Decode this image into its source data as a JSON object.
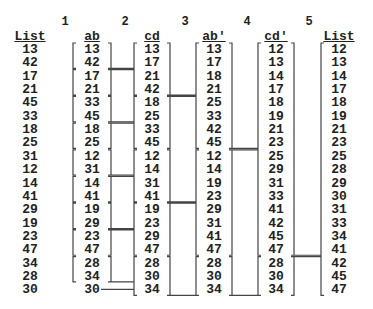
{
  "steps": [
    "1",
    "2",
    "3",
    "4",
    "5"
  ],
  "columns": [
    {
      "header": "List",
      "values": [
        "13",
        "42",
        "17",
        "21",
        "45",
        "33",
        "18",
        "25",
        "31",
        "12",
        "14",
        "41",
        "29",
        "19",
        "23",
        "47",
        "34",
        "28",
        "30"
      ]
    },
    {
      "header": "ab",
      "values": [
        "13",
        "42",
        "17",
        "21",
        "33",
        "45",
        "18",
        "25",
        "12",
        "31",
        "14",
        "41",
        "19",
        "29",
        "23",
        "47",
        "28",
        "34",
        "30"
      ]
    },
    {
      "header": "cd",
      "values": [
        "13",
        "17",
        "21",
        "42",
        "18",
        "25",
        "33",
        "45",
        "12",
        "14",
        "31",
        "41",
        "19",
        "23",
        "29",
        "47",
        "28",
        "30",
        "34"
      ]
    },
    {
      "header": "ab'",
      "values": [
        "13",
        "17",
        "18",
        "21",
        "25",
        "33",
        "42",
        "45",
        "12",
        "14",
        "19",
        "23",
        "29",
        "31",
        "41",
        "47",
        "28",
        "30",
        "34"
      ]
    },
    {
      "header": "cd'",
      "values": [
        "12",
        "13",
        "14",
        "17",
        "18",
        "19",
        "21",
        "23",
        "25",
        "29",
        "31",
        "33",
        "41",
        "42",
        "45",
        "47",
        "28",
        "30",
        "34"
      ]
    },
    {
      "header": "List",
      "values": [
        "12",
        "13",
        "14",
        "17",
        "18",
        "19",
        "21",
        "23",
        "25",
        "28",
        "29",
        "30",
        "31",
        "33",
        "34",
        "41",
        "42",
        "45",
        "47"
      ]
    }
  ]
}
